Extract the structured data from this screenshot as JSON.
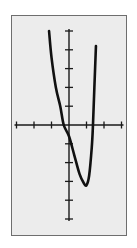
{
  "chart_data": {
    "type": "line",
    "title": "",
    "xlabel": "",
    "ylabel": "",
    "xlim": [
      -3,
      3
    ],
    "ylim": [
      -5,
      5
    ],
    "x_ticks": [
      -3,
      -2,
      -1,
      1,
      2,
      3
    ],
    "y_ticks": [
      -5,
      -4,
      -3,
      -2,
      -1,
      1,
      2,
      3,
      4,
      5
    ],
    "tick_labels_shown": false,
    "grid": false,
    "legend": null,
    "series": [
      {
        "name": "f(x)",
        "x": [
          -1.14,
          -1.0,
          -0.75,
          -0.5,
          -0.3,
          0.0,
          0.3,
          0.6,
          0.85,
          1.0,
          1.15,
          1.3,
          1.37,
          1.45,
          1.54
        ],
        "y": [
          5.0,
          3.6,
          2.0,
          1.0,
          0.0,
          -0.6,
          -1.6,
          -2.6,
          -3.1,
          -3.2,
          -2.7,
          -1.2,
          0.0,
          2.0,
          4.2
        ]
      }
    ],
    "features": {
      "local_minimum": {
        "x": 1.0,
        "y": -3.2
      },
      "y_intercept": -0.6,
      "x_intercepts": [
        -0.3,
        1.37
      ]
    }
  },
  "colors": {
    "background": "#ececec",
    "frame": "#6e6e6e",
    "axis": "#1a1a1a",
    "curve": "#111111"
  }
}
